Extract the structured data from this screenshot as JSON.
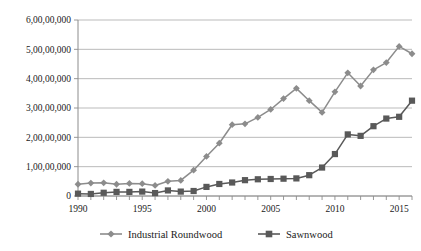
{
  "chart_data": {
    "type": "line",
    "title": "",
    "subtitle": "",
    "xlabel": "",
    "ylabel": "",
    "grid": "horizontal",
    "legend_position": "bottom",
    "x": [
      1990,
      1991,
      1992,
      1993,
      1994,
      1995,
      1996,
      1997,
      1998,
      1999,
      2000,
      2001,
      2002,
      2003,
      2004,
      2005,
      2006,
      2007,
      2008,
      2009,
      2010,
      2011,
      2012,
      2013,
      2014,
      2015,
      2016
    ],
    "xtick_labels": [
      "1990",
      "1995",
      "2000",
      "2005",
      "2010",
      "2015"
    ],
    "xtick_values": [
      1990,
      1995,
      2000,
      2005,
      2010,
      2015
    ],
    "xlim": [
      1990,
      2016
    ],
    "ylim": [
      0,
      60000000
    ],
    "ytick_labels": [
      "0",
      "1,00,00,000",
      "2,00,00,000",
      "3,00,00,000",
      "4,00,00,000",
      "5,00,00,000",
      "6,00,00,000"
    ],
    "ytick_values": [
      0,
      10000000,
      20000000,
      30000000,
      40000000,
      50000000,
      60000000
    ],
    "series": [
      {
        "name": "Industrial Roundwood",
        "marker": "diamond",
        "color": "#8c8c8c",
        "values": [
          4000000,
          4400000,
          4500000,
          4000000,
          4300000,
          4200000,
          3600000,
          5000000,
          5300000,
          8800000,
          13500000,
          18000000,
          24300000,
          24600000,
          26800000,
          29500000,
          33200000,
          36700000,
          32500000,
          28500000,
          35500000,
          42000000,
          37500000,
          43000000,
          45500000,
          51000000,
          48500000
        ]
      },
      {
        "name": "Sawnwood",
        "marker": "square",
        "color": "#595959",
        "values": [
          800000,
          700000,
          1100000,
          1400000,
          1400000,
          1500000,
          1000000,
          1900000,
          1500000,
          1700000,
          3100000,
          4100000,
          4600000,
          5400000,
          5700000,
          5800000,
          5900000,
          6000000,
          7100000,
          9700000,
          14300000,
          21000000,
          20500000,
          23800000,
          26400000,
          27000000,
          32500000
        ]
      }
    ]
  },
  "legend": {
    "entries": [
      {
        "label": "Industrial Roundwood",
        "marker": "diamond-marker-icon"
      },
      {
        "label": "Sawnwood",
        "marker": "square-marker-icon"
      }
    ]
  },
  "colors": {
    "roundwood": "#8c8c8c",
    "sawnwood": "#595959",
    "gridline": "#b3b3b3",
    "axis": "#8c8c8c",
    "text": "#1a1a1a",
    "background": "#ffffff"
  }
}
